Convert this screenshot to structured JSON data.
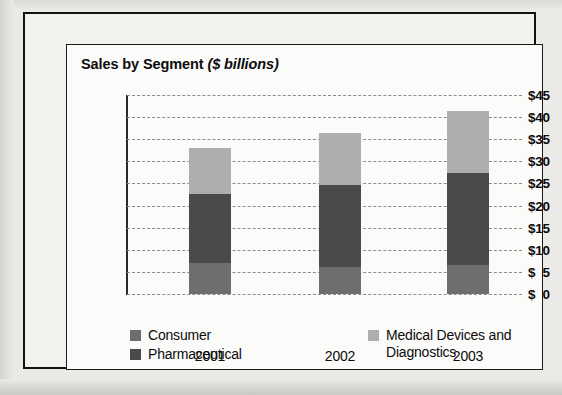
{
  "chart_data": {
    "type": "bar",
    "stacked": true,
    "title": "Sales by Segment",
    "title_units": "($ billions)",
    "xlabel": "",
    "ylabel": "",
    "categories": [
      "2001",
      "2002",
      "2003"
    ],
    "series": [
      {
        "name": "Consumer",
        "color": "#6e6e6e",
        "values": [
          7,
          6,
          6.6
        ]
      },
      {
        "name": "Pharmaceutical",
        "color": "#4a4a4a",
        "values": [
          15.6,
          18.7,
          20.8
        ]
      },
      {
        "name": "Medical Devices and Diagnostics",
        "color": "#aeaeae",
        "values": [
          10.4,
          11.7,
          14
        ]
      }
    ],
    "totals": [
      33,
      36.4,
      41.4
    ],
    "ylim": [
      0,
      45
    ],
    "ytick_values": [
      0,
      5,
      10,
      15,
      20,
      25,
      30,
      35,
      40,
      45
    ],
    "ytick_labels": [
      "$  0",
      "$  5",
      "$10",
      "$15",
      "$20",
      "$25",
      "$30",
      "$35",
      "$40",
      "$45"
    ],
    "grid": "horizontal-dashed",
    "legend_position": "bottom",
    "legend_entries": [
      {
        "label": "Consumer",
        "color": "#6e6e6e"
      },
      {
        "label": "Pharmaceutical",
        "color": "#4a4a4a"
      },
      {
        "label": "Medical Devices and",
        "label_line2": "Diagnostics",
        "color": "#aeaeae"
      }
    ]
  },
  "legend": {
    "consumer": "Consumer",
    "pharmaceutical": "Pharmaceutical",
    "devices_line1": "Medical Devices and",
    "devices_line2": "Diagnostics"
  }
}
